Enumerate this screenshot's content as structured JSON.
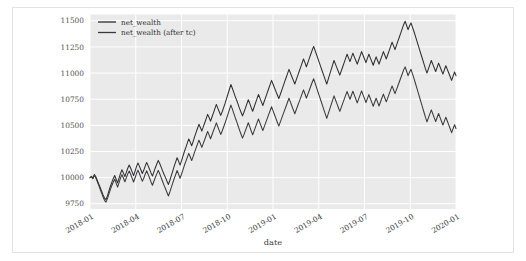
{
  "figure": {
    "background_color": "#ffffff",
    "frame_color": "#e3e3e6",
    "plot_background_color": "#eaeaea",
    "grid_color": "#ffffff"
  },
  "chart_data": {
    "type": "line",
    "title": "",
    "xlabel": "date",
    "ylabel": "",
    "grid": true,
    "legend_position": "top-left",
    "xlim": [
      "2018-01",
      "2020-02"
    ],
    "ylim": [
      9700,
      11560
    ],
    "yticks": [
      9750,
      10000,
      10250,
      10500,
      10750,
      11000,
      11250,
      11500
    ],
    "ytick_labels": [
      "9750",
      "10000",
      "10250",
      "10500",
      "10750",
      "11000",
      "11250",
      "11500"
    ],
    "xticks": [
      "2018-01",
      "2018-04",
      "2018-07",
      "2018-10",
      "2019-01",
      "2019-04",
      "2019-07",
      "2019-10",
      "2020-01"
    ],
    "xtick_labels": [
      "2018-01",
      "2018-04",
      "2018-07",
      "2018-10",
      "2019-01",
      "2019-04",
      "2019-07",
      "2019-10",
      "2020-01"
    ],
    "series": [
      {
        "name": "net_wealth",
        "color": "#2e2e31",
        "values": [
          10000,
          10012,
          9995,
          10030,
          10008,
          9975,
          9940,
          9905,
          9870,
          9835,
          9805,
          9790,
          9825,
          9870,
          9915,
          9955,
          9990,
          10020,
          9985,
          9950,
          9995,
          10040,
          10075,
          10045,
          10010,
          10050,
          10090,
          10120,
          10090,
          10055,
          10020,
          10060,
          10105,
          10140,
          10110,
          10075,
          10040,
          10070,
          10110,
          10145,
          10115,
          10080,
          10045,
          10015,
          10055,
          10095,
          10130,
          10165,
          10135,
          10100,
          10065,
          10030,
          10000,
          9965,
          9935,
          9975,
          10020,
          10065,
          10110,
          10150,
          10190,
          10155,
          10120,
          10160,
          10205,
          10250,
          10290,
          10330,
          10370,
          10340,
          10305,
          10345,
          10390,
          10430,
          10470,
          10510,
          10480,
          10445,
          10485,
          10525,
          10565,
          10605,
          10575,
          10540,
          10580,
          10620,
          10660,
          10700,
          10665,
          10630,
          10595,
          10630,
          10670,
          10710,
          10755,
          10800,
          10845,
          10890,
          10855,
          10815,
          10775,
          10740,
          10700,
          10660,
          10625,
          10590,
          10625,
          10665,
          10705,
          10745,
          10710,
          10670,
          10635,
          10675,
          10715,
          10755,
          10795,
          10760,
          10725,
          10690,
          10730,
          10770,
          10810,
          10850,
          10890,
          10930,
          10895,
          10860,
          10825,
          10790,
          10755,
          10795,
          10835,
          10875,
          10915,
          10955,
          10995,
          11035,
          11000,
          10965,
          10930,
          10895,
          10935,
          10975,
          11015,
          11055,
          11095,
          11135,
          11100,
          11060,
          11100,
          11140,
          11180,
          11220,
          11255,
          11215,
          11175,
          11135,
          11095,
          11055,
          11015,
          10975,
          10935,
          10895,
          10940,
          10985,
          11030,
          11075,
          11120,
          11085,
          11050,
          11015,
          10980,
          11020,
          11060,
          11100,
          11140,
          11180,
          11145,
          11110,
          11150,
          11190,
          11155,
          11120,
          11085,
          11125,
          11165,
          11205,
          11170,
          11135,
          11100,
          11140,
          11180,
          11145,
          11110,
          11075,
          11115,
          11155,
          11120,
          11085,
          11125,
          11165,
          11205,
          11170,
          11135,
          11175,
          11215,
          11255,
          11295,
          11260,
          11225,
          11265,
          11305,
          11345,
          11385,
          11425,
          11465,
          11495,
          11455,
          11415,
          11450,
          11480,
          11440,
          11400,
          11355,
          11310,
          11265,
          11220,
          11175,
          11130,
          11085,
          11040,
          11000,
          11040,
          11080,
          11120,
          11085,
          11050,
          11015,
          11055,
          11095,
          11060,
          11025,
          10990,
          11030,
          11070,
          11035,
          11000,
          10965,
          10930,
          10970,
          11010,
          10975
        ]
      },
      {
        "name": "net_wealth (after tc)",
        "color": "#3a3a3d",
        "values": [
          10000,
          10010,
          9990,
          10022,
          9998,
          9963,
          9926,
          9889,
          9852,
          9815,
          9783,
          9766,
          9799,
          9842,
          9885,
          9923,
          9956,
          9984,
          9947,
          9910,
          9953,
          9996,
          10029,
          9997,
          9960,
          9998,
          10036,
          10064,
          10032,
          9995,
          9958,
          9996,
          10039,
          10072,
          10040,
          10003,
          9966,
          9994,
          10032,
          10065,
          10033,
          9996,
          9959,
          9927,
          9965,
          10003,
          10036,
          10069,
          10037,
          10000,
          9963,
          9926,
          9894,
          9857,
          9825,
          9863,
          9906,
          9949,
          9992,
          10030,
          10068,
          10031,
          9994,
          10032,
          10075,
          10118,
          10156,
          10194,
          10232,
          10200,
          10163,
          10201,
          10244,
          10282,
          10320,
          10358,
          10326,
          10289,
          10327,
          10365,
          10403,
          10441,
          10409,
          10372,
          10410,
          10448,
          10486,
          10524,
          10487,
          10450,
          10413,
          10446,
          10484,
          10522,
          10565,
          10608,
          10651,
          10694,
          10657,
          10615,
          10573,
          10536,
          10494,
          10452,
          10415,
          10378,
          10411,
          10449,
          10487,
          10525,
          10488,
          10446,
          10409,
          10447,
          10485,
          10523,
          10561,
          10524,
          10487,
          10450,
          10488,
          10526,
          10564,
          10602,
          10640,
          10678,
          10641,
          10604,
          10567,
          10530,
          10493,
          10531,
          10569,
          10607,
          10645,
          10683,
          10721,
          10759,
          10722,
          10685,
          10648,
          10611,
          10649,
          10687,
          10725,
          10763,
          10801,
          10839,
          10802,
          10760,
          10798,
          10836,
          10874,
          10912,
          10945,
          10903,
          10861,
          10819,
          10777,
          10735,
          10693,
          10651,
          10609,
          10567,
          10610,
          10653,
          10696,
          10739,
          10782,
          10745,
          10708,
          10671,
          10634,
          10672,
          10710,
          10748,
          10786,
          10824,
          10787,
          10750,
          10788,
          10826,
          10789,
          10752,
          10715,
          10753,
          10791,
          10829,
          10792,
          10755,
          10718,
          10756,
          10794,
          10757,
          10720,
          10683,
          10721,
          10759,
          10722,
          10685,
          10723,
          10761,
          10799,
          10762,
          10725,
          10763,
          10801,
          10839,
          10877,
          10840,
          10803,
          10841,
          10879,
          10917,
          10955,
          10993,
          11031,
          11059,
          11017,
          10975,
          11008,
          11036,
          10994,
          10952,
          10905,
          10858,
          10811,
          10764,
          10717,
          10670,
          10623,
          10576,
          10534,
          10572,
          10610,
          10648,
          10611,
          10574,
          10537,
          10575,
          10613,
          10576,
          10539,
          10502,
          10540,
          10578,
          10541,
          10504,
          10467,
          10430,
          10468,
          10506,
          10470
        ]
      }
    ]
  },
  "legend": {
    "entries": [
      {
        "label": "net_wealth",
        "color": "#2e2e31"
      },
      {
        "label": "net_wealth (after tc)",
        "color": "#3a3a3d"
      }
    ]
  }
}
